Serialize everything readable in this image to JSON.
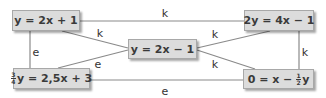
{
  "nodes": {
    "top_left": {
      "text": "y = 2x + 1"
    },
    "top_right": {
      "text": "2y = 4x − 1"
    },
    "center": {
      "text": "y = 2x − 1"
    },
    "bottom_left": {
      "frac_num": "3",
      "frac_den": "4",
      "text": "y = 2,5x + 3"
    },
    "bottom_right": {
      "text_before": "0 = x − ",
      "frac_num": "1",
      "frac_den": "2",
      "text_after": "y"
    }
  },
  "edges": {
    "top": "k",
    "bottom": "e",
    "left": "e",
    "right": "k",
    "top_left_center": "k",
    "bottom_left_center": "e",
    "top_right_center": "k",
    "bottom_right_center": "k"
  },
  "colors": {
    "node_fill": "#dcdcdc",
    "edge": "#8a8a8a",
    "text": "#3a3a3a"
  }
}
